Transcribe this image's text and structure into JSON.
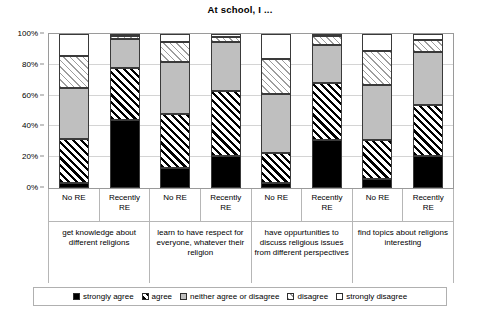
{
  "chart": {
    "title": "At school, I  ...",
    "type": "bar"
  },
  "yaxis": {
    "ticks": [
      "0%",
      "20%",
      "40%",
      "60%",
      "80%",
      "100%"
    ]
  },
  "legend": {
    "items": [
      {
        "label": "strongly agree",
        "style": "solid-black",
        "color": "#000000"
      },
      {
        "label": "agree",
        "style": "diagonal-hatch-dark",
        "color": "#000000"
      },
      {
        "label": "neither agree or disagree",
        "style": "solid-gray",
        "color": "#bfbfbf"
      },
      {
        "label": "disagree",
        "style": "diagonal-hatch-light",
        "color": "#9d9d9d"
      },
      {
        "label": "strongly disagree",
        "style": "solid-white",
        "color": "#ffffff"
      }
    ]
  },
  "series_labels": [
    "No RE",
    "Recently RE",
    "No RE",
    "Recently RE",
    "No RE",
    "Recently RE",
    "No RE",
    "Recently RE"
  ],
  "group_labels": [
    "get knowledge about different religions",
    "learn to have respect for everyone, whatever their religion",
    "have oppurtunities to discuss religious issues from different perspectives",
    "find topics about religions interesting"
  ],
  "chart_data": {
    "type": "bar",
    "title": "At school, I  ...",
    "xlabel": "",
    "ylabel": "",
    "ylim": [
      0,
      100
    ],
    "yticks": [
      0,
      20,
      40,
      60,
      80,
      100
    ],
    "ytick_labels": [
      "0%",
      "20%",
      "40%",
      "60%",
      "80%",
      "100%"
    ],
    "grid": true,
    "stacked": true,
    "legend_position": "bottom",
    "groups": [
      "get knowledge about different religions",
      "learn to have respect for everyone, whatever their religion",
      "have oppurtunities to discuss religious issues from different perspectives",
      "find topics about religions interesting"
    ],
    "categories": [
      "No RE",
      "Recently RE",
      "No RE",
      "Recently RE",
      "No RE",
      "Recently RE",
      "No RE",
      "Recently RE"
    ],
    "series": [
      {
        "name": "strongly agree",
        "values": [
          3,
          44,
          13,
          21,
          3,
          31,
          6,
          21
        ]
      },
      {
        "name": "agree",
        "values": [
          29,
          34,
          35,
          42,
          20,
          37,
          25,
          33
        ]
      },
      {
        "name": "neither agree or disagree",
        "values": [
          33,
          19,
          34,
          32,
          38,
          25,
          36,
          34
        ]
      },
      {
        "name": "disagree",
        "values": [
          21,
          2,
          13,
          3,
          23,
          6,
          22,
          8
        ]
      },
      {
        "name": "strongly disagree",
        "values": [
          14,
          1,
          5,
          2,
          16,
          1,
          11,
          4
        ]
      }
    ]
  }
}
